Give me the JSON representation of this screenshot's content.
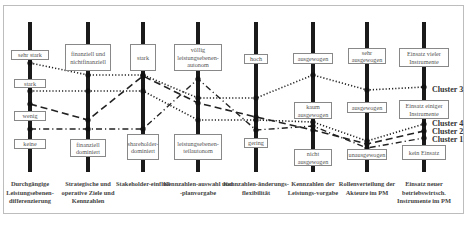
{
  "columns": [
    {
      "label": "Durchgängige Leistungsebenen-differenzierung",
      "x": 30,
      "options": [
        {
          "text": "sehr stark",
          "y": 50,
          "w": 38,
          "h": 10
        },
        {
          "text": "stark",
          "y": 79,
          "w": 32,
          "h": 9
        },
        {
          "text": "wenig",
          "y": 111,
          "w": 32,
          "h": 10
        },
        {
          "text": "keine",
          "y": 139,
          "w": 32,
          "h": 10
        }
      ]
    },
    {
      "label": "Strategische und operative Ziele und Kennzahlen",
      "x": 88,
      "options": [
        {
          "text": "finanziell und nichtfinanziell",
          "y": 44,
          "w": 46,
          "h": 27
        },
        {
          "text": "finanziell dominiert",
          "y": 139,
          "w": 36,
          "h": 18
        }
      ]
    },
    {
      "label": "Stakeholder-einfluß",
      "x": 143,
      "options": [
        {
          "text": "stark",
          "y": 44,
          "w": 26,
          "h": 27
        },
        {
          "text": "shareholder-dominiert",
          "y": 134,
          "w": 32,
          "h": 26
        }
      ]
    },
    {
      "label": "Kennzahlen-auswahl und -planvorgabe",
      "x": 198,
      "options": [
        {
          "text": "völlig leistungsebenen-autonom",
          "y": 44,
          "w": 48,
          "h": 27
        },
        {
          "text": "leistungsebenen-teilautonom",
          "y": 134,
          "w": 48,
          "h": 26
        }
      ]
    },
    {
      "label": "Kennzahlen-änderungs-flexibilität",
      "x": 256,
      "options": [
        {
          "text": "hoch",
          "y": 54,
          "w": 24,
          "h": 10
        },
        {
          "text": "gering",
          "y": 138,
          "w": 24,
          "h": 10
        }
      ]
    },
    {
      "label": "Kennzahlen der Leistungs-vorgabe",
      "x": 313,
      "options": [
        {
          "text": "ausgewogen",
          "y": 53,
          "w": 40,
          "h": 11
        },
        {
          "text": "kaum ausgewogen",
          "y": 102,
          "w": 38,
          "h": 17
        },
        {
          "text": "nicht ausgewogen",
          "y": 149,
          "w": 38,
          "h": 17
        }
      ]
    },
    {
      "label": "Rollenverteilung der Akteure im PM",
      "x": 367,
      "options": [
        {
          "text": "sehr ausgewogen",
          "y": 48,
          "w": 38,
          "h": 16
        },
        {
          "text": "ausgewogen",
          "y": 102,
          "w": 40,
          "h": 11
        },
        {
          "text": "unausgewogen",
          "y": 149,
          "w": 40,
          "h": 11
        }
      ]
    },
    {
      "label": "Einsatz neuer betriebswirtsch. Instrumente im PM",
      "x": 424,
      "options": [
        {
          "text": "Einsatz vieler Instrumente",
          "y": 48,
          "w": 50,
          "h": 19
        },
        {
          "text": "Einsatz einiger Instrumente",
          "y": 100,
          "w": 50,
          "h": 19
        },
        {
          "text": "kein Einsatz",
          "y": 145,
          "w": 44,
          "h": 15
        }
      ]
    }
  ],
  "clusters": [
    {
      "name": "Cluster 3",
      "style": "dotted",
      "label_y": 90,
      "points_y": [
        63,
        75,
        75,
        98,
        98,
        75,
        90,
        87
      ]
    },
    {
      "name": "Cluster 4",
      "style": "dotted",
      "label_y": 124,
      "points_y": [
        91,
        91,
        91,
        120,
        120,
        122,
        141,
        124
      ]
    },
    {
      "name": "Cluster 2",
      "style": "dashed",
      "label_y": 132,
      "points_y": [
        104,
        120,
        76,
        103,
        117,
        130,
        144,
        131
      ]
    },
    {
      "name": "Cluster 1",
      "style": "dashdot",
      "label_y": 140,
      "points_y": [
        129,
        129,
        129,
        79,
        130,
        126,
        148,
        138
      ]
    }
  ],
  "colors": {
    "axis": "#1a1a1a",
    "line": "#222222",
    "box_border": "#888888",
    "text": "#444444",
    "frame": "#bdbdbd"
  }
}
